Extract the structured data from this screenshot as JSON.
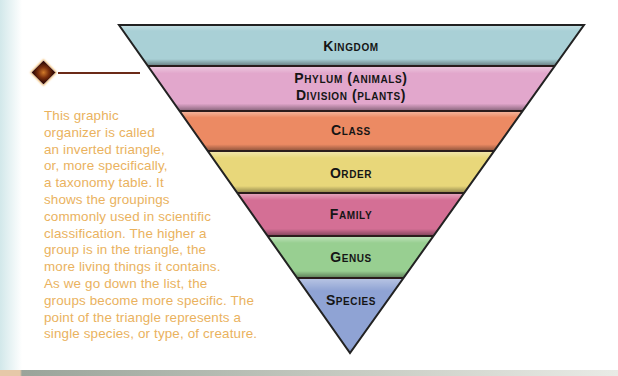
{
  "diagram": {
    "type": "inverted-triangle",
    "title": "Taxonomy table",
    "levels": [
      {
        "label": "Kingdom",
        "color": "#a9d0d6"
      },
      {
        "label": "Phylum (animals)",
        "label2": "Division (plants)",
        "color": "#e2a7cc"
      },
      {
        "label": "Class",
        "color": "#ec8a63"
      },
      {
        "label": "Order",
        "color": "#e8d77a"
      },
      {
        "label": "Family",
        "color": "#d46f95"
      },
      {
        "label": "Genus",
        "color": "#98cf91"
      },
      {
        "label": "Species",
        "color": "#8fa3d4"
      }
    ]
  },
  "description": {
    "lines": [
      "This graphic",
      "organizer is called",
      "an inverted triangle,",
      "or, more specifically,",
      "a taxonomy table. It",
      "shows the groupings",
      "commonly used in scientific",
      "classification. The higher a",
      "group is in the triangle, the",
      "more living things it contains.",
      "As we go down the list, the",
      "groups become more specific. The",
      "point of the triangle represents a",
      "single species, or type, of creature."
    ],
    "text_color": "#eab25e"
  },
  "pointer": {
    "icon": "diamond-bullet-icon",
    "color": "#7a2e0c"
  }
}
